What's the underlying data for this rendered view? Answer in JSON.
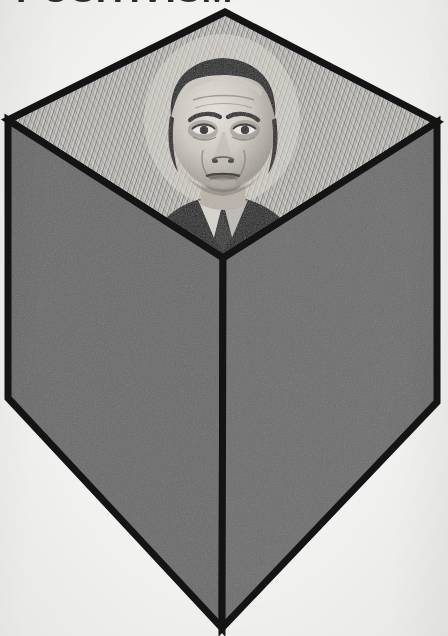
{
  "page": {
    "title": "POSITIVISM",
    "background_color": "#f2f2f0",
    "width": 448,
    "height": 636
  },
  "figure": {
    "name": "isometric-cube-with-portrait",
    "caption_visible": false,
    "outline_color": "#141414",
    "top_face": {
      "label": "portrait-face",
      "subject": "Auguste Comte",
      "technique": "engraved halftone portrait on cross-hatched ground",
      "base_color": "#c9c7c2",
      "ink_color": "#1a1a1a",
      "vertices": "225,12 8,120 223,258 437,122"
    },
    "left_face": {
      "label": "left-face",
      "fill_color": "#6b6b6b",
      "vertices": "8,120 223,258 222,628 8,398"
    },
    "right_face": {
      "label": "right-face",
      "fill_color": "#6e6e6e",
      "vertices": "437,122 437,402 222,628 223,258"
    }
  }
}
